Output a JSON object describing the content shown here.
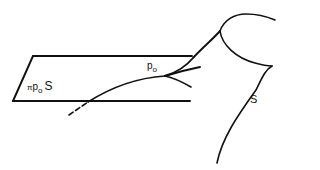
{
  "figure": {
    "labels": {
      "tangent_plane": {
        "symbol": "π",
        "point": "p",
        "subscript": "o",
        "surface": "S"
      },
      "point": {
        "name": "p",
        "subscript": "o"
      },
      "surface": {
        "name": "S"
      }
    },
    "colors": {
      "ink": "#111111",
      "background": "#ffffff"
    }
  }
}
